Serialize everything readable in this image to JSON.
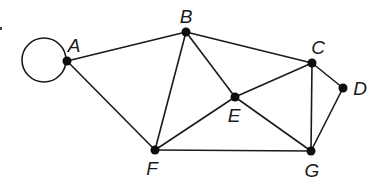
{
  "diagram": {
    "type": "undirected-graph",
    "nodes": [
      {
        "id": "A",
        "label": "A",
        "x": 67,
        "y": 61,
        "lx": 74,
        "ly": 52
      },
      {
        "id": "B",
        "label": "B",
        "x": 186,
        "y": 32,
        "lx": 186,
        "ly": 23
      },
      {
        "id": "C",
        "label": "C",
        "x": 312,
        "y": 63,
        "lx": 318,
        "ly": 54
      },
      {
        "id": "D",
        "label": "D",
        "x": 343,
        "y": 88,
        "lx": 360,
        "ly": 95
      },
      {
        "id": "E",
        "label": "E",
        "x": 235,
        "y": 97,
        "lx": 234,
        "ly": 122
      },
      {
        "id": "F",
        "label": "F",
        "x": 155,
        "y": 150,
        "lx": 152,
        "ly": 175
      },
      {
        "id": "G",
        "label": "G",
        "x": 311,
        "y": 151,
        "lx": 312,
        "ly": 177
      }
    ],
    "edges": [
      [
        "A",
        "B"
      ],
      [
        "A",
        "F"
      ],
      [
        "B",
        "F"
      ],
      [
        "B",
        "E"
      ],
      [
        "B",
        "C"
      ],
      [
        "C",
        "E"
      ],
      [
        "C",
        "G"
      ],
      [
        "C",
        "D"
      ],
      [
        "D",
        "G"
      ],
      [
        "E",
        "F"
      ],
      [
        "E",
        "G"
      ],
      [
        "F",
        "G"
      ]
    ],
    "loops": [
      {
        "node": "A",
        "cx": 44,
        "cy": 60,
        "r": 22
      }
    ]
  }
}
